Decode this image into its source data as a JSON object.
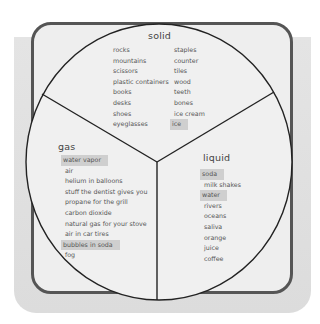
{
  "diagram": {
    "type": "pie-sorting",
    "colors": {
      "frame_border": "#555555",
      "frame_fill": "#eeeeee",
      "shadow": "#dddddd",
      "highlight": "#cfcfcf",
      "divider": "#222222"
    },
    "solid": {
      "heading": "solid",
      "column_1": [
        "rocks",
        "mountains",
        "scissors",
        "plastic containers",
        "books",
        "desks",
        "shoes",
        "eyeglasses"
      ],
      "column_2": [
        "staples",
        "counter",
        "tiles",
        "wood",
        "teeth",
        "bones",
        "ice cream",
        "ice"
      ],
      "highlighted": [
        "ice"
      ]
    },
    "gas": {
      "heading": "gas",
      "items": [
        "water vapor",
        "air",
        "helium in balloons",
        "stuff the dentist gives you",
        "propane for the grill",
        "carbon dioxide",
        "natural gas for your stove",
        "air in car tires",
        "bubbles in soda",
        "fog"
      ],
      "highlighted": [
        "water vapor",
        "bubbles in soda"
      ]
    },
    "liquid": {
      "heading": "liquid",
      "items": [
        "soda",
        "milk shakes",
        "water",
        "rivers",
        "oceans",
        "saliva",
        "orange",
        "juice",
        "coffee"
      ],
      "highlighted": [
        "soda",
        "water"
      ]
    }
  }
}
